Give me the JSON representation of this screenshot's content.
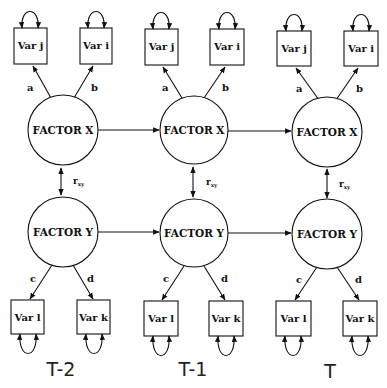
{
  "diagram": {
    "type": "cross-lagged latent factor path model",
    "time_points": [
      {
        "label": "T-2",
        "factor_x": {
          "label": "FACTOR X"
        },
        "factor_y": {
          "label": "FACTOR Y"
        },
        "indicators_x": [
          {
            "label": "Var j",
            "loading": "a"
          },
          {
            "label": "Var i",
            "loading": "b"
          }
        ],
        "indicators_y": [
          {
            "label": "Var l",
            "loading": "c"
          },
          {
            "label": "Var k",
            "loading": "d"
          }
        ],
        "correlation": {
          "label": "r",
          "subscript": "xy"
        }
      },
      {
        "label": "T-1",
        "factor_x": {
          "label": "FACTOR X"
        },
        "factor_y": {
          "label": "FACTOR Y"
        },
        "indicators_x": [
          {
            "label": "Var j",
            "loading": "a"
          },
          {
            "label": "Var i",
            "loading": "b"
          }
        ],
        "indicators_y": [
          {
            "label": "Var l",
            "loading": "c"
          },
          {
            "label": "Var k",
            "loading": "d"
          }
        ],
        "correlation": {
          "label": "r",
          "subscript": "xy"
        }
      },
      {
        "label": "T",
        "factor_x": {
          "label": "FACTOR X"
        },
        "factor_y": {
          "label": "FACTOR Y"
        },
        "indicators_x": [
          {
            "label": "Var j",
            "loading": "a"
          },
          {
            "label": "Var i",
            "loading": "b"
          }
        ],
        "indicators_y": [
          {
            "label": "Var l",
            "loading": "c"
          },
          {
            "label": "Var k",
            "loading": "d"
          }
        ],
        "correlation": {
          "label": "r",
          "subscript": "xy"
        }
      }
    ],
    "edges": [
      {
        "from": "FACTOR X (T-2)",
        "to": "FACTOR X (T-1)",
        "type": "directed"
      },
      {
        "from": "FACTOR X (T-1)",
        "to": "FACTOR X (T)",
        "type": "directed"
      },
      {
        "from": "FACTOR Y (T-2)",
        "to": "FACTOR Y (T-1)",
        "type": "directed"
      },
      {
        "from": "FACTOR Y (T-1)",
        "to": "FACTOR Y (T)",
        "type": "directed"
      }
    ],
    "colors": {
      "line": "#111111",
      "background": "#ffffff"
    }
  }
}
